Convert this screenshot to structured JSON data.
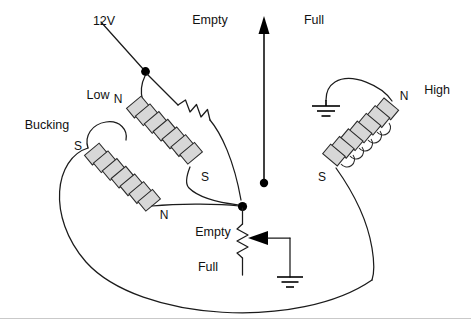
{
  "diagram": {
    "background_color": "#ffffff",
    "wire_color": "#1b1b1b",
    "coil_fill_color": "#d7d7d7",
    "coil_stroke_color": "#2b2b2b",
    "footer_rule_color": "#c9c9c9",
    "width": 471,
    "height": 331
  },
  "labels": {
    "supply": "12V",
    "gauge_empty_top": "Empty",
    "gauge_full_top": "Full",
    "coil_low": "Low",
    "coil_bucking": "Bucking",
    "coil_high": "High",
    "pot_empty": "Empty",
    "pot_full": "Full"
  },
  "poles": {
    "low_n": "N",
    "low_s": "S",
    "bucking_s": "S",
    "bucking_n": "N",
    "high_n": "N",
    "high_s": "S"
  },
  "components": {
    "needle": {
      "name": "gauge-needle",
      "direction": "up",
      "low_end_label": "Empty",
      "high_end_label": "Full"
    },
    "series_resistor": {
      "name": "series-resistor",
      "orientation": "diagonal"
    },
    "potentiometer": {
      "name": "sender-potentiometer",
      "top_label": "Empty",
      "bottom_label": "Full",
      "wiper": "ground"
    },
    "grounds": [
      {
        "name": "ground-high-coil"
      },
      {
        "name": "ground-potentiometer-wiper"
      }
    ],
    "junctions": [
      {
        "name": "junction-12v-low-coil"
      },
      {
        "name": "junction-coil-common"
      }
    ],
    "coils": [
      {
        "name": "coil-low",
        "label": "Low",
        "start_pole": "N",
        "end_pole": "S",
        "turns": 7
      },
      {
        "name": "coil-bucking",
        "label": "Bucking",
        "start_pole": "S",
        "end_pole": "N",
        "turns": 7
      },
      {
        "name": "coil-high",
        "label": "High",
        "start_pole": "N",
        "end_pole": "S",
        "turns": 6
      }
    ]
  }
}
